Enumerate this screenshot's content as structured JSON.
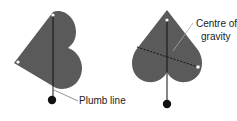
{
  "diagram": {
    "labels": {
      "plumb_line": "Plumb line",
      "centre_line1": "Centre of",
      "centre_line2": "gravity"
    },
    "colors": {
      "shape_fill": "#595959",
      "line": "#111111",
      "bob": "#111111",
      "leader": "#777777",
      "pin": "#ffffff"
    }
  }
}
